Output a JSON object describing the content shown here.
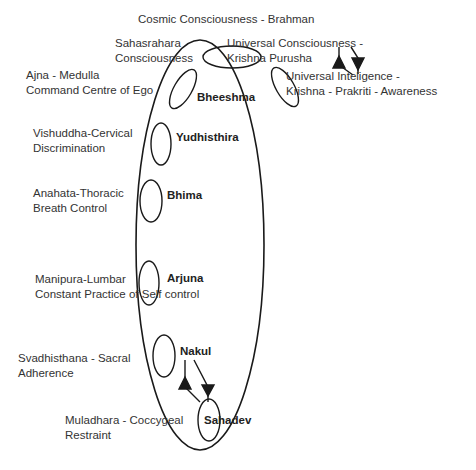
{
  "title": "Cosmic Consciousness - Brahman",
  "chakras": [
    {
      "id": "sahasrahara",
      "line1": "Sahasrahara",
      "line2": "Consciousness"
    },
    {
      "id": "ajna",
      "line1": "Ajna - Medulla",
      "line2": "Command Centre of Ego"
    },
    {
      "id": "vishuddha",
      "line1": "Vishuddha-Cervical",
      "line2": "Discrimination"
    },
    {
      "id": "anahata",
      "line1": "Anahata-Thoracic",
      "line2": "Breath Control"
    },
    {
      "id": "manipura",
      "line1": "Manipura-Lumbar",
      "line2": "Constant Practice of Self control"
    },
    {
      "id": "svadhisthana",
      "line1": "Svadhisthana - Sacral",
      "line2": "Adherence"
    },
    {
      "id": "muladhara",
      "line1": "Muladhara - Coccygeal",
      "line2": "Restraint"
    }
  ],
  "figures": [
    {
      "id": "bheeshma",
      "name": "Bheeshma"
    },
    {
      "id": "yudhisthira",
      "name": "Yudhisthira"
    },
    {
      "id": "bhima",
      "name": "Bhima"
    },
    {
      "id": "arjuna",
      "name": "Arjuna"
    },
    {
      "id": "nakul",
      "name": "Nakul"
    },
    {
      "id": "sahadev",
      "name": "Sahadev"
    }
  ],
  "universal": {
    "purusha": {
      "line1": "Universal Consciousness -",
      "line2": "Krishna Purusha"
    },
    "prakriti": {
      "line1": "Universal Inteligence -",
      "line2": "Krishna - Prakriti - Awareness"
    }
  },
  "colors": {
    "stroke": "#1a1a1a",
    "text": "#333333",
    "background": "#ffffff"
  }
}
